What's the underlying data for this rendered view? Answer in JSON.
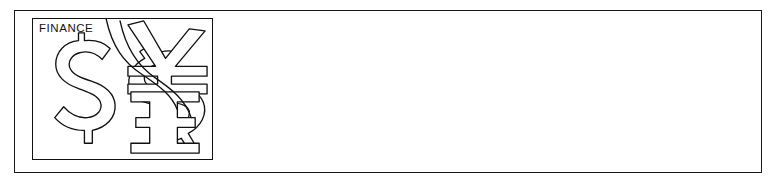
{
  "banner": {
    "caption": "FINANCE",
    "content_text": "",
    "colors": {
      "background": "#ffffff",
      "frame_stroke": "#1a1a1a",
      "logo_stroke": "#111111",
      "caption_text": "#141414"
    },
    "logo": {
      "title": "FINANCE",
      "style": "black-and-white outline line art",
      "symbols": [
        {
          "name": "dollar-sign-large",
          "glyph": "$",
          "description": "large outlined dollar sign at left"
        },
        {
          "name": "dollar-sign-overlapping",
          "glyph": "$",
          "description": "second outlined dollar sign overlapping the first, rotated"
        },
        {
          "name": "yen-sign",
          "glyph": "¥",
          "description": "rotated outlined yen sign at upper right"
        },
        {
          "name": "pound-sterling-sign",
          "glyph": "£",
          "description": "rotated outlined pound / E-like sign at lower right"
        }
      ]
    }
  }
}
